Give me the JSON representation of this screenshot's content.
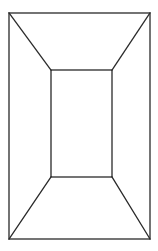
{
  "diagram": {
    "type": "line-drawing",
    "canvas": {
      "width": 158,
      "height": 251,
      "background": "#ffffff"
    },
    "stroke": {
      "color": "#2a2a2a",
      "width": 1.3
    },
    "outer_rect": {
      "x1": 9,
      "y1": 13,
      "x2": 150,
      "y2": 239
    },
    "inner_rect": {
      "x1": 51,
      "y1": 70,
      "x2": 112,
      "y2": 177
    },
    "connectors": [
      {
        "name": "top-left",
        "from": [
          9,
          13
        ],
        "to": [
          51,
          70
        ]
      },
      {
        "name": "top-right",
        "from": [
          150,
          13
        ],
        "to": [
          112,
          70
        ]
      },
      {
        "name": "bottom-left",
        "from": [
          9,
          239
        ],
        "to": [
          51,
          177
        ]
      },
      {
        "name": "bottom-right",
        "from": [
          150,
          239
        ],
        "to": [
          112,
          177
        ]
      }
    ]
  }
}
